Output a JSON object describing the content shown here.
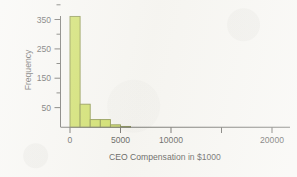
{
  "figure": {
    "background_color": "#f6f5f1",
    "bar_fill_color": "#c6d94b",
    "bar_edge_color": "#6f7a23",
    "axis_color": "#55544f",
    "text_color": "#3a3a38"
  },
  "chart_data": {
    "type": "bar",
    "title": "",
    "subtitle": "",
    "xlabel": "CEO Compensation in $1000",
    "ylabel": "Frequency",
    "xlim": [
      0,
      23000
    ],
    "ylim": [
      0,
      390
    ],
    "grid": false,
    "legend": null,
    "legend_position": "none",
    "bin_width": 1000,
    "x_tick_labels": [
      "0",
      "5000",
      "10000",
      "20000"
    ],
    "x_tick_values": [
      0,
      5000,
      10000,
      20000
    ],
    "x_tick_values_all": [
      0,
      5000,
      10000,
      15000,
      20000
    ],
    "y_tick_labels": [
      "50",
      "150",
      "250",
      "350"
    ],
    "y_tick_values": [
      50,
      150,
      250,
      350
    ],
    "y_minor_tick_values": [
      100,
      200,
      300,
      400
    ],
    "categories": [
      "0-1000",
      "1000-2000",
      "2000-3000",
      "3000-4000",
      "4000-5000",
      "5000-6000"
    ],
    "bin_edges": [
      0,
      1000,
      2000,
      3000,
      4000,
      5000,
      6000
    ],
    "values": [
      360,
      75,
      25,
      25,
      8,
      3
    ],
    "annotations": []
  },
  "labels": {
    "y_axis_title": "Frequency",
    "x_axis_title": "CEO Compensation in $1000",
    "y_350": "350",
    "y_250": "250",
    "y_150": "150",
    "y_50": "50",
    "x_0": "0",
    "x_5000": "5000",
    "x_10000": "10000",
    "x_20000": "20000"
  }
}
